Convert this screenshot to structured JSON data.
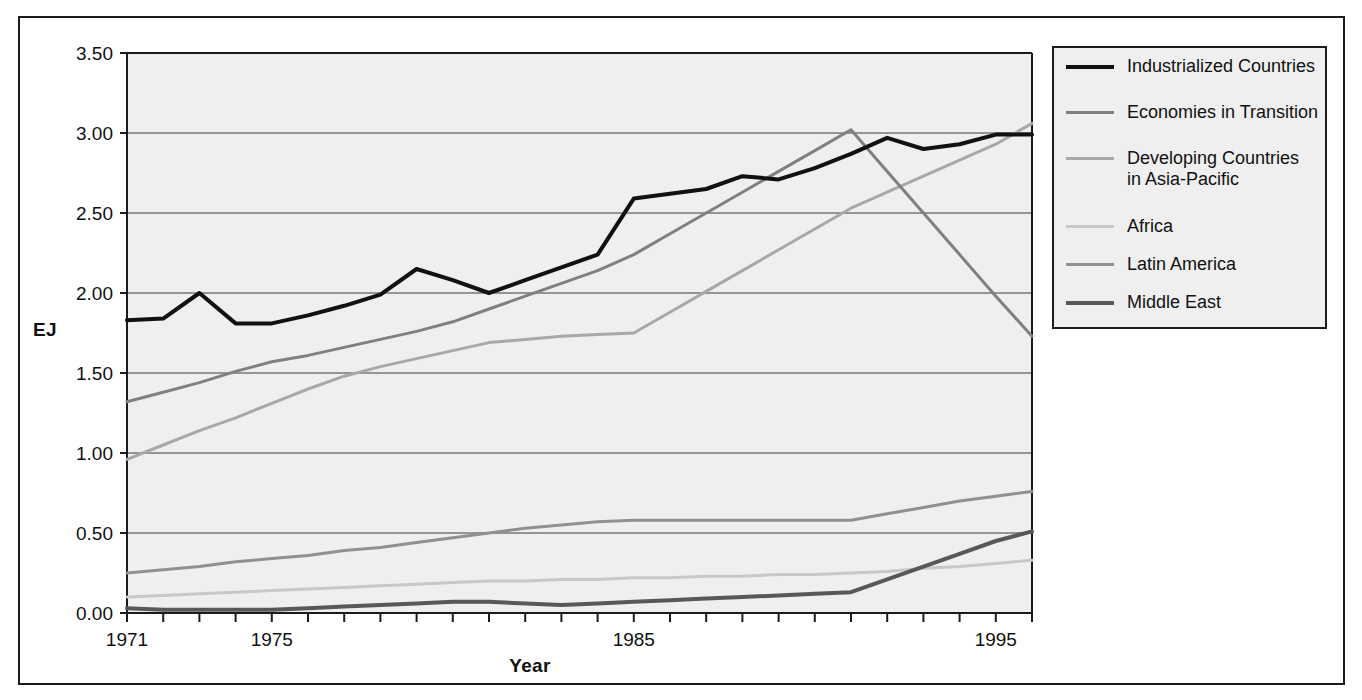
{
  "figure": {
    "background": "#ffffff",
    "plot_background": "#efefef",
    "frame_color": "#1b1b1b"
  },
  "axis": {
    "y_title": "EJ",
    "x_title": "Year",
    "y_ticks": [
      "0.00",
      "0.50",
      "1.00",
      "1.50",
      "2.00",
      "2.50",
      "3.00",
      "3.50"
    ],
    "x_ticks_labeled": [
      "1971",
      "1975",
      "1985",
      "1995"
    ]
  },
  "legend": {
    "items": [
      {
        "label": "Industrialized Countries",
        "color": "#111111",
        "width": 4
      },
      {
        "label": "Economies in Transition",
        "color": "#808080",
        "width": 3
      },
      {
        "label": "Developing Countries\nin Asia-Pacific",
        "color": "#a8a8a8",
        "width": 3
      },
      {
        "label": "Africa",
        "color": "#c8c8c8",
        "width": 3
      },
      {
        "label": "Latin America",
        "color": "#909090",
        "width": 3
      },
      {
        "label": "Middle East",
        "color": "#585858",
        "width": 4
      }
    ]
  },
  "chart_data": {
    "type": "line",
    "title": "",
    "xlabel": "Year",
    "ylabel": "EJ",
    "xlim": [
      1971,
      1996
    ],
    "ylim": [
      0.0,
      3.5
    ],
    "yticks": [
      0.0,
      0.5,
      1.0,
      1.5,
      2.0,
      2.5,
      3.0,
      3.5
    ],
    "xticks_labeled": [
      1971,
      1975,
      1985,
      1995
    ],
    "grid": "horizontal",
    "legend_position": "right-outside",
    "x": [
      1971,
      1972,
      1973,
      1974,
      1975,
      1976,
      1977,
      1978,
      1979,
      1980,
      1981,
      1982,
      1983,
      1984,
      1985,
      1986,
      1987,
      1988,
      1989,
      1990,
      1991,
      1992,
      1993,
      1994,
      1995,
      1996
    ],
    "series": [
      {
        "name": "Industrialized Countries",
        "color": "#111111",
        "values": [
          1.83,
          1.84,
          2.0,
          1.81,
          1.81,
          1.86,
          1.92,
          1.99,
          2.15,
          2.08,
          2.0,
          2.08,
          2.16,
          2.24,
          2.59,
          2.62,
          2.65,
          2.73,
          2.71,
          2.78,
          2.87,
          2.97,
          2.9,
          2.93,
          2.99,
          2.99
        ]
      },
      {
        "name": "Economies in Transition",
        "color": "#808080",
        "values": [
          1.32,
          1.38,
          1.44,
          1.51,
          1.57,
          1.61,
          1.66,
          1.71,
          1.76,
          1.82,
          1.9,
          1.98,
          2.06,
          2.14,
          2.24,
          2.37,
          2.5,
          2.63,
          2.76,
          2.89,
          3.02,
          2.76,
          2.5,
          2.24,
          1.98,
          1.73
        ]
      },
      {
        "name": "Developing Countries in Asia-Pacific",
        "color": "#a8a8a8",
        "values": [
          0.96,
          1.05,
          1.14,
          1.22,
          1.31,
          1.4,
          1.48,
          1.54,
          1.59,
          1.64,
          1.69,
          1.71,
          1.73,
          1.74,
          1.75,
          1.88,
          2.01,
          2.14,
          2.27,
          2.4,
          2.53,
          2.63,
          2.73,
          2.83,
          2.93,
          3.06
        ]
      },
      {
        "name": "Africa",
        "color": "#c8c8c8",
        "values": [
          0.1,
          0.11,
          0.12,
          0.13,
          0.14,
          0.15,
          0.16,
          0.17,
          0.18,
          0.19,
          0.2,
          0.2,
          0.21,
          0.21,
          0.22,
          0.22,
          0.23,
          0.23,
          0.24,
          0.24,
          0.25,
          0.26,
          0.28,
          0.29,
          0.31,
          0.33
        ]
      },
      {
        "name": "Latin America",
        "color": "#909090",
        "values": [
          0.25,
          0.27,
          0.29,
          0.32,
          0.34,
          0.36,
          0.39,
          0.41,
          0.44,
          0.47,
          0.5,
          0.53,
          0.55,
          0.57,
          0.58,
          0.58,
          0.58,
          0.58,
          0.58,
          0.58,
          0.58,
          0.62,
          0.66,
          0.7,
          0.73,
          0.76
        ]
      },
      {
        "name": "Middle East",
        "color": "#585858",
        "values": [
          0.03,
          0.02,
          0.02,
          0.02,
          0.02,
          0.03,
          0.04,
          0.05,
          0.06,
          0.07,
          0.07,
          0.06,
          0.05,
          0.06,
          0.07,
          0.08,
          0.09,
          0.1,
          0.11,
          0.12,
          0.13,
          0.21,
          0.29,
          0.37,
          0.45,
          0.51
        ]
      }
    ]
  }
}
